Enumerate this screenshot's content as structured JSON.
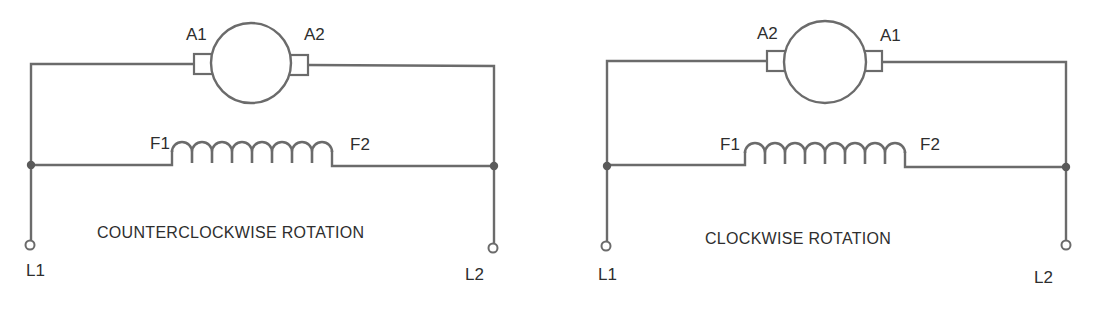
{
  "colors": {
    "background": "#ffffff",
    "line": "#6b6b6b",
    "text": "#2e2e2e"
  },
  "diagrams": [
    {
      "caption": "COUNTERCLOCKWISE ROTATION",
      "armature_left_label": "A1",
      "armature_right_label": "A2",
      "field_left_label": "F1",
      "field_right_label": "F2",
      "line_left_label": "L1",
      "line_right_label": "L2"
    },
    {
      "caption": "CLOCKWISE ROTATION",
      "armature_left_label": "A2",
      "armature_right_label": "A1",
      "field_left_label": "F1",
      "field_right_label": "F2",
      "line_left_label": "L1",
      "line_right_label": "L2"
    }
  ]
}
